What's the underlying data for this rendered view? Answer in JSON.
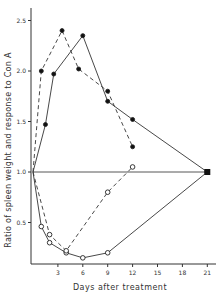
{
  "chart_data": {
    "type": "line",
    "title": "",
    "xlabel": "Days after treatment",
    "ylabel": "Ratio of spleen weight and response to Con A",
    "xlim": [
      0,
      22
    ],
    "ylim": [
      0,
      2.6
    ],
    "x_ticks": [
      3,
      6,
      9,
      12,
      15,
      18,
      21
    ],
    "y_ticks": [
      0.5,
      1.0,
      1.5,
      2.0,
      2.5
    ],
    "y_tick_labels": [
      "0.5",
      "1.0",
      "1.5",
      "2.0",
      "2.5"
    ],
    "grid": false,
    "legend": null,
    "reference_line": {
      "y": 1.0,
      "x_from": 0,
      "x_to": 21
    },
    "series": [
      {
        "name": "filled-solid",
        "marker": "filled-circle",
        "line": "solid",
        "x": [
          0,
          1.5,
          2.5,
          6,
          9,
          12,
          21
        ],
        "y": [
          1.0,
          1.47,
          1.97,
          2.35,
          1.7,
          1.52,
          1.0
        ]
      },
      {
        "name": "filled-dashed",
        "marker": "filled-circle",
        "line": "dashed",
        "x": [
          0,
          1,
          3.5,
          5.5,
          9,
          12
        ],
        "y": [
          1.0,
          2.0,
          2.4,
          2.02,
          1.8,
          1.25
        ]
      },
      {
        "name": "open-solid",
        "marker": "open-circle",
        "line": "solid",
        "x": [
          0,
          1,
          2,
          4,
          6,
          9,
          21
        ],
        "y": [
          1.0,
          0.46,
          0.3,
          0.2,
          0.15,
          0.2,
          1.0
        ]
      },
      {
        "name": "open-dashed",
        "marker": "open-circle",
        "line": "dashed",
        "x": [
          0,
          2,
          4,
          9,
          12
        ],
        "y": [
          1.0,
          0.38,
          0.22,
          0.8,
          1.05
        ]
      }
    ]
  }
}
